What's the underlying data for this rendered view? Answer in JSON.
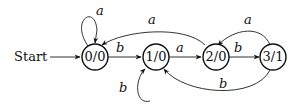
{
  "diagram": {
    "type": "finite-state-machine",
    "start_label": "Start",
    "states": [
      {
        "id": "s0",
        "label": "0/0"
      },
      {
        "id": "s1",
        "label": "1/0"
      },
      {
        "id": "s2",
        "label": "2/0"
      },
      {
        "id": "s3",
        "label": "3/1"
      }
    ],
    "transitions": [
      {
        "from": "s0",
        "to": "s0",
        "label": "a"
      },
      {
        "from": "s0",
        "to": "s1",
        "label": "b"
      },
      {
        "from": "s1",
        "to": "s1",
        "label": "b"
      },
      {
        "from": "s1",
        "to": "s2",
        "label": "a"
      },
      {
        "from": "s2",
        "to": "s0",
        "label": "a"
      },
      {
        "from": "s2",
        "to": "s3",
        "label": "b"
      },
      {
        "from": "s3",
        "to": "s2",
        "label": "a"
      },
      {
        "from": "s3",
        "to": "s1",
        "label": "b"
      }
    ]
  }
}
